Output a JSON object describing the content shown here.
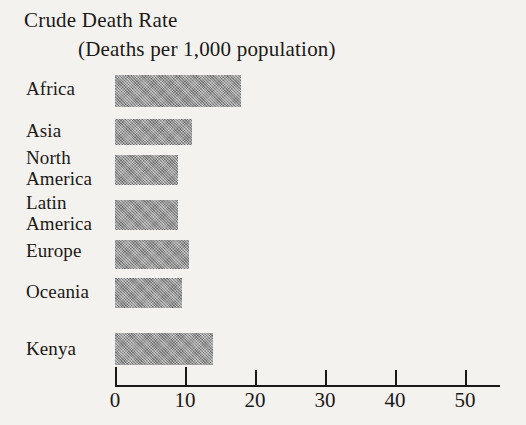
{
  "chart_data": {
    "type": "bar",
    "orientation": "horizontal",
    "title": "Crude Death Rate",
    "subtitle": "(Deaths per 1,000 population)",
    "xlabel": "",
    "ylabel": "",
    "categories": [
      "Africa",
      "Asia",
      "North\nAmerica",
      "Latin\nAmerica",
      "Europe",
      "Oceania",
      "Kenya"
    ],
    "values": [
      18,
      11,
      9,
      9,
      10.5,
      9.5,
      14
    ],
    "xlim": [
      0,
      55
    ],
    "xticks": [
      0,
      10,
      20,
      30,
      40,
      50
    ],
    "xtick_labels": [
      "0",
      "10",
      "20",
      "30",
      "40",
      "50"
    ],
    "grid": false,
    "legend": false,
    "bar_color": "#8d8d8d",
    "axis_color": "#1b1917",
    "background_color": "#f4f2ee"
  },
  "layout": {
    "axis_x0_px": 115,
    "axis_px_per_unit": 7,
    "axis_y_px": 385,
    "bars": [
      {
        "top": 75,
        "height": 32,
        "label_top": 78,
        "label_left": 26
      },
      {
        "top": 119,
        "height": 26,
        "label_top": 120,
        "label_left": 26
      },
      {
        "top": 155,
        "height": 30,
        "label_top": 147,
        "label_left": 26
      },
      {
        "top": 200,
        "height": 30,
        "label_top": 192,
        "label_left": 26
      },
      {
        "top": 240,
        "height": 29,
        "label_top": 240,
        "label_left": 26
      },
      {
        "top": 278,
        "height": 30,
        "label_top": 281,
        "label_left": 26
      },
      {
        "top": 333,
        "height": 32,
        "label_top": 338,
        "label_left": 26
      }
    ]
  }
}
